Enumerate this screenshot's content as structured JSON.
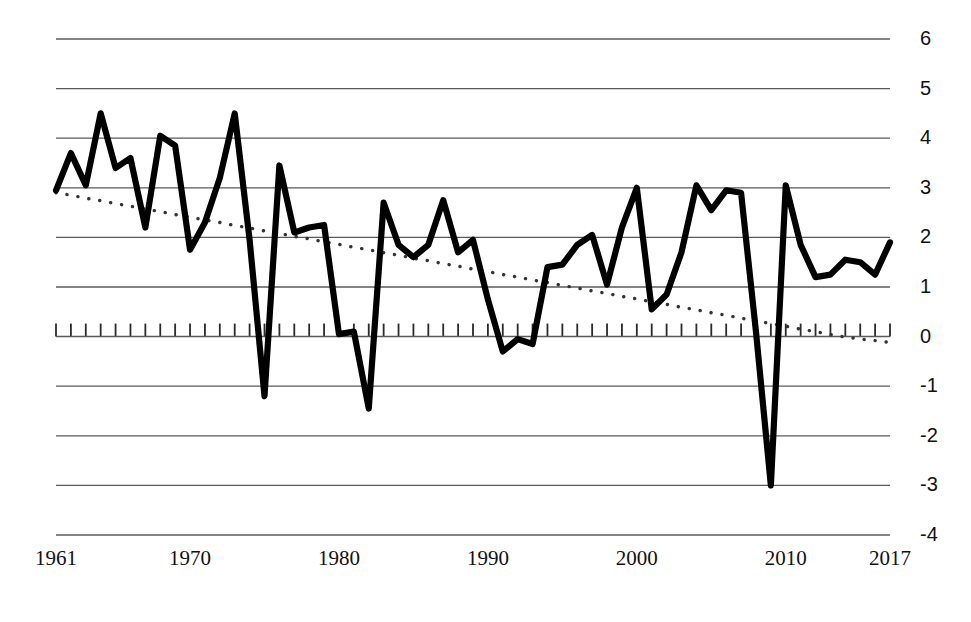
{
  "chart_data": {
    "type": "line",
    "title": "",
    "subtitle": "",
    "xlabel": "",
    "ylabel": "",
    "xlim": [
      1961,
      2017
    ],
    "ylim": [
      -4,
      6
    ],
    "grid": true,
    "legend": "none",
    "ytick_labels": [
      "6",
      "5",
      "4",
      "3",
      "2",
      "1",
      "0",
      "-1",
      "-2",
      "-3",
      "-4"
    ],
    "ytick_values": [
      6,
      5,
      4,
      3,
      2,
      1,
      0,
      -1,
      -2,
      -3,
      -4
    ],
    "xtick_labels": [
      "1961",
      "1970",
      "1980",
      "1990",
      "2000",
      "2010",
      "2017"
    ],
    "xtick_values": [
      1961,
      1970,
      1980,
      1990,
      2000,
      2010,
      2017
    ],
    "x": [
      1961,
      1962,
      1963,
      1964,
      1965,
      1966,
      1967,
      1968,
      1969,
      1970,
      1971,
      1972,
      1973,
      1974,
      1975,
      1976,
      1977,
      1978,
      1979,
      1980,
      1981,
      1982,
      1983,
      1984,
      1985,
      1986,
      1987,
      1988,
      1989,
      1990,
      1991,
      1992,
      1993,
      1994,
      1995,
      1996,
      1997,
      1998,
      1999,
      2000,
      2001,
      2002,
      2003,
      2004,
      2005,
      2006,
      2007,
      2008,
      2009,
      2010,
      2011,
      2012,
      2013,
      2014,
      2015,
      2016,
      2017
    ],
    "series": [
      {
        "name": "annual-growth",
        "style": "solid",
        "color": "#000000",
        "values": [
          2.95,
          3.7,
          3.05,
          4.5,
          3.4,
          3.6,
          2.2,
          4.05,
          3.85,
          1.75,
          2.3,
          3.2,
          4.5,
          1.95,
          -1.2,
          3.45,
          2.1,
          2.2,
          2.25,
          0.05,
          0.1,
          -1.45,
          2.7,
          1.85,
          1.6,
          1.85,
          2.75,
          1.7,
          1.95,
          0.75,
          -0.3,
          -0.05,
          -0.15,
          1.4,
          1.45,
          1.85,
          2.05,
          1.05,
          2.2,
          3.0,
          0.55,
          0.85,
          1.7,
          3.05,
          2.55,
          2.95,
          2.9,
          0.1,
          -3.0,
          3.05,
          1.85,
          1.2,
          1.25,
          1.55,
          1.5,
          1.25,
          1.9
        ]
      },
      {
        "name": "trend-line",
        "style": "dotted",
        "color": "#333333",
        "values": [
          2.9,
          2.85,
          2.79,
          2.74,
          2.68,
          2.63,
          2.57,
          2.52,
          2.46,
          2.41,
          2.35,
          2.3,
          2.24,
          2.19,
          2.13,
          2.08,
          2.02,
          1.97,
          1.91,
          1.86,
          1.8,
          1.75,
          1.69,
          1.64,
          1.58,
          1.53,
          1.47,
          1.42,
          1.36,
          1.31,
          1.25,
          1.2,
          1.14,
          1.09,
          1.03,
          0.98,
          0.92,
          0.87,
          0.81,
          0.76,
          0.7,
          0.65,
          0.59,
          0.54,
          0.48,
          0.43,
          0.37,
          0.32,
          0.26,
          0.21,
          0.15,
          0.1,
          0.04,
          -0.01,
          -0.05,
          -0.08,
          -0.12
        ]
      }
    ]
  },
  "axis": {
    "zero_line_value": 0,
    "tick_count": 57
  }
}
